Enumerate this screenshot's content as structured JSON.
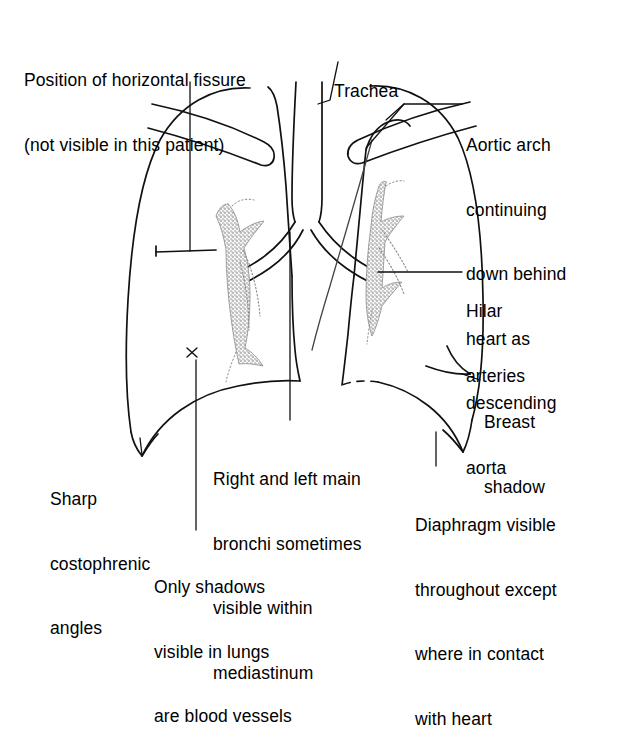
{
  "figure": {
    "ink_color": "#000000",
    "background_color": "#ffffff",
    "stipple_color": "#6b6b6b"
  },
  "annotations": {
    "horizontal_fissure": {
      "name": "position-of-horizontal-fissure",
      "lines": [
        "Position of horizontal fissure",
        "(not visible in this patient)"
      ]
    },
    "trachea": {
      "name": "trachea",
      "lines": [
        "Trachea"
      ]
    },
    "aortic_arch": {
      "name": "aortic-arch",
      "lines": [
        "Aortic arch",
        "continuing",
        "down behind",
        "heart as",
        "descending",
        "aorta"
      ]
    },
    "hilar_arteries": {
      "name": "hilar-arteries",
      "lines": [
        "Hilar",
        "arteries"
      ]
    },
    "breast_shadow": {
      "name": "breast-shadow",
      "lines": [
        "Breast",
        "shadow"
      ]
    },
    "costophrenic_angles": {
      "name": "sharp-costophrenic-angles",
      "lines": [
        "Sharp",
        "costophrenic",
        "angles"
      ]
    },
    "main_bronchi": {
      "name": "right-and-left-main-bronchi",
      "lines": [
        "Right and left main",
        "bronchi sometimes",
        "visible within",
        "mediastinum"
      ]
    },
    "diaphragm": {
      "name": "diaphragm",
      "lines": [
        "Diaphragm visible",
        "throughout except",
        "where in contact",
        "with heart"
      ]
    },
    "blood_vessels": {
      "name": "only-shadows-are-blood-vessels",
      "lines": [
        "Only shadows",
        "visible in lungs",
        "are blood vessels"
      ]
    }
  },
  "anatomy_parts": [
    "right-lung-outline",
    "left-lung-outline",
    "right-clavicle",
    "left-clavicle",
    "trachea",
    "right-main-bronchus",
    "left-main-bronchus",
    "aortic-arch",
    "descending-aorta",
    "right-hilar-vessels",
    "left-hilar-vessels",
    "right-hemidiaphragm",
    "left-hemidiaphragm",
    "right-costophrenic-angle",
    "left-costophrenic-angle",
    "breast-shadow-arc",
    "horizontal-fissure-marker",
    "vessel-marker-cross"
  ]
}
